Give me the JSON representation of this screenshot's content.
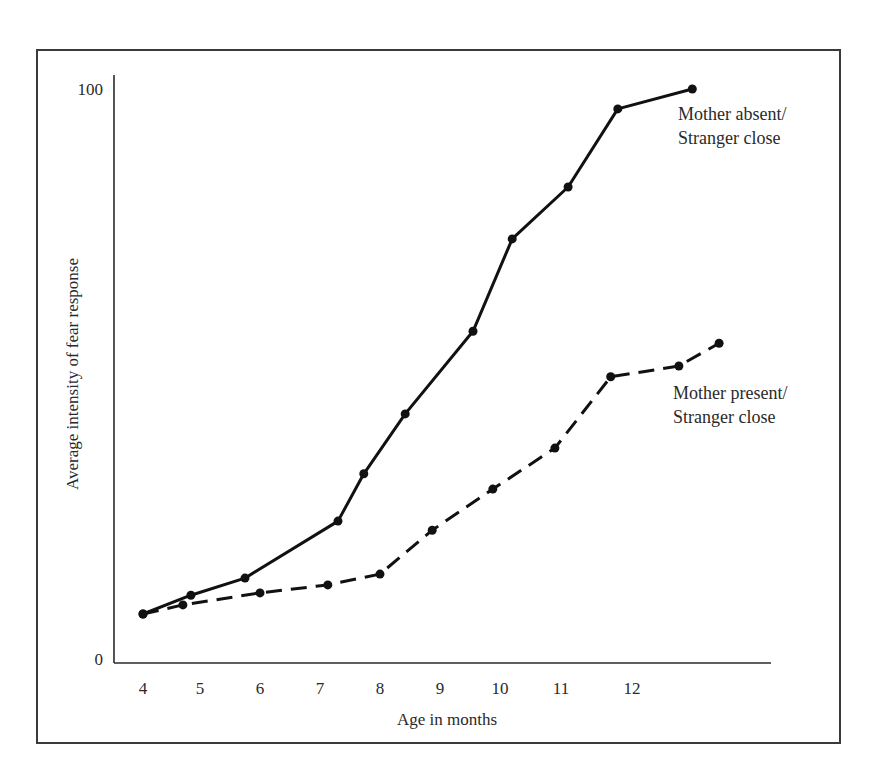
{
  "chart_data": {
    "type": "line",
    "title": "",
    "xlabel": "Age in months",
    "ylabel": "Average intensity of fear response",
    "xlim": [
      3.95,
      14.1
    ],
    "ylim": [
      0,
      100
    ],
    "x_ticks": [
      4,
      5,
      6,
      7,
      8,
      9,
      10,
      11,
      12
    ],
    "y_ticks": [
      0,
      100
    ],
    "grid": false,
    "legend": "inline labels at line ends",
    "series": [
      {
        "name": "Mother absent/ Stranger close",
        "label_lines": [
          "Mother absent/",
          "Stranger close"
        ],
        "style": "solid",
        "x": [
          4.0,
          4.84,
          5.75,
          7.3,
          7.73,
          8.42,
          9.55,
          10.2,
          11.1,
          11.8,
          12.9
        ],
        "y": [
          7.9,
          11.2,
          14.2,
          24.2,
          32.5,
          43.0,
          57.5,
          73.7,
          82.8,
          96.5,
          100.0
        ]
      },
      {
        "name": "Mother present/ Stranger close",
        "label_lines": [
          "Mother present/",
          "Stranger close"
        ],
        "style": "dashed",
        "x": [
          4.0,
          4.7,
          6.0,
          7.13,
          8.0,
          8.87,
          9.88,
          10.9,
          11.7,
          12.7,
          13.3
        ],
        "y": [
          7.9,
          9.5,
          11.6,
          13.0,
          14.9,
          22.6,
          29.8,
          37.0,
          49.5,
          51.4,
          55.4
        ]
      }
    ]
  },
  "labels": {
    "y_top": "100",
    "y_bottom": "0",
    "x_title": "Age in months",
    "y_title": "Average intensity of fear response",
    "x_ticks": [
      "4",
      "5",
      "6",
      "7",
      "8",
      "9",
      "10",
      "11",
      "12"
    ],
    "series_absent_line1": "Mother absent/",
    "series_absent_line2": "Stranger close",
    "series_present_line1": "Mother present/",
    "series_present_line2": "Stranger close"
  }
}
